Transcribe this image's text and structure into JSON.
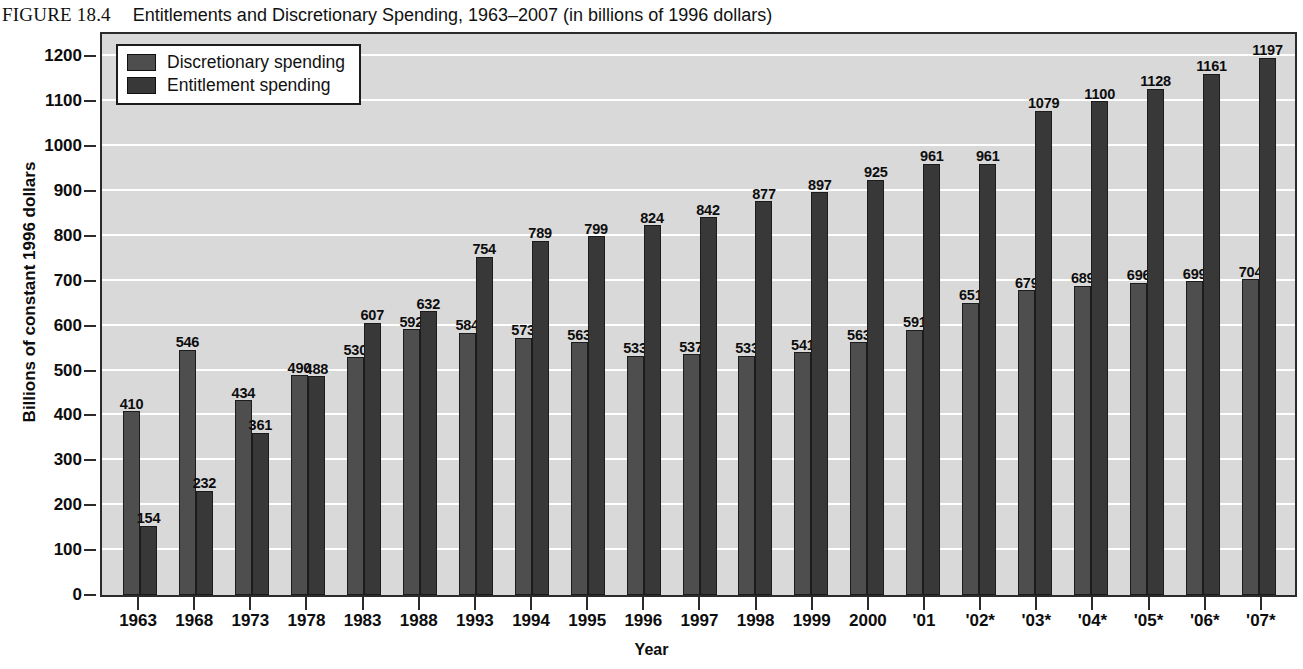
{
  "figure": {
    "label": "FIGURE 18.4",
    "title": "Entitlements and Discretionary Spending, 1963–2007 (in billions of 1996 dollars)"
  },
  "legend": {
    "position": "top-left-inside",
    "entries": [
      {
        "label": "Discretionary spending",
        "color": "#4e4e4e"
      },
      {
        "label": "Entitlement spending",
        "color": "#383838"
      }
    ]
  },
  "colors": {
    "discretionary": "#4e4e4e",
    "entitlement": "#383838",
    "plot_background": "#d9d9d9",
    "gridline": "#ffffff",
    "axis": "#2b2b2b"
  },
  "chart_data": {
    "type": "bar",
    "title": "Entitlements and Discretionary Spending, 1963–2007 (in billions of 1996 dollars)",
    "xlabel": "Year",
    "ylabel": "Billions of constant 1996 dollars",
    "ylim": [
      0,
      1250
    ],
    "yticks": [
      0,
      100,
      200,
      300,
      400,
      500,
      600,
      700,
      800,
      900,
      1000,
      1100,
      1200
    ],
    "grid": true,
    "legend_position": "upper left",
    "categories": [
      "1963",
      "1968",
      "1973",
      "1978",
      "1983",
      "1988",
      "1993",
      "1994",
      "1995",
      "1996",
      "1997",
      "1998",
      "1999",
      "2000",
      "'01",
      "'02*",
      "'03*",
      "'04*",
      "'05*",
      "'06*",
      "'07*"
    ],
    "series": [
      {
        "name": "Discretionary spending",
        "color": "#4e4e4e",
        "values": [
          410,
          546,
          434,
          490,
          530,
          592,
          584,
          573,
          563,
          533,
          537,
          533,
          541,
          563,
          591,
          651,
          679,
          689,
          696,
          699,
          704
        ]
      },
      {
        "name": "Entitlement spending",
        "color": "#383838",
        "values": [
          154,
          232,
          361,
          488,
          607,
          632,
          754,
          789,
          799,
          824,
          842,
          877,
          897,
          925,
          961,
          961,
          1079,
          1100,
          1128,
          1161,
          1197
        ]
      }
    ]
  }
}
